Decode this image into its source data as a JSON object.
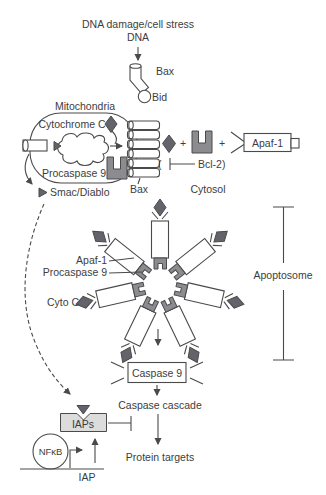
{
  "colors": {
    "shape_gray": "#63636b",
    "notch_gray": "#8b8b90",
    "box_fill": "#dcdcdc",
    "line": "#4a4a4a"
  },
  "upstream": {
    "stress": "DNA damage/cell stress",
    "dna": "DNA",
    "bax": "Bax",
    "bid": "Bid"
  },
  "mitochondria": {
    "label": "Mitochondria",
    "cytochrome_c": "Cytochrome C",
    "procaspase9": "Procaspase 9",
    "smac_diablo": "Smac/Diablo",
    "bax_channel": "Bax"
  },
  "cytosol": {
    "plus1": "+",
    "plus2": "+",
    "apaf1": "Apaf-1",
    "bcl2_paren": "(",
    "bcl2": "Bcl-2)",
    "label": "Cytosol"
  },
  "apoptosome": {
    "apaf1_label": "Apaf-1",
    "procaspase9_label": "Procaspase 9",
    "cytoc_label": "Cyto C",
    "bracket_label": "Apoptosome"
  },
  "downstream": {
    "caspase9": "Caspase 9",
    "cascade": "Caspase cascade",
    "targets": "Protein targets"
  },
  "iap_regulation": {
    "iaps": "IAPs",
    "nfkb": "NFκB",
    "gene": "IAP"
  }
}
